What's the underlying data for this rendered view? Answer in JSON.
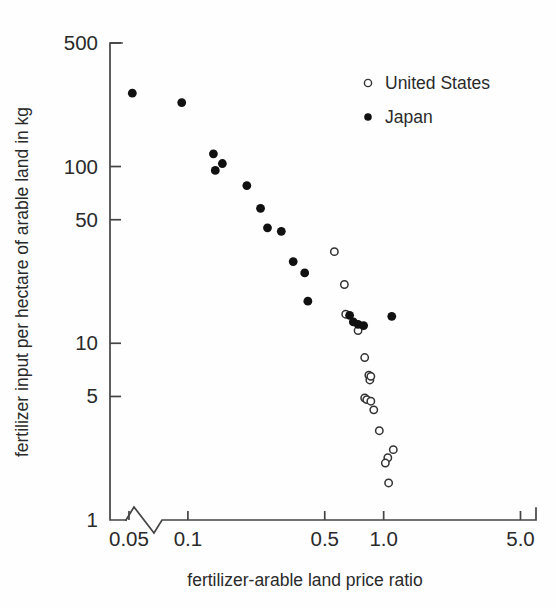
{
  "chart_data": {
    "type": "scatter",
    "title": "",
    "xlabel": "fertilizer-arable land price ratio",
    "ylabel": "fertilizer input per hectare of arable land in kg",
    "xscale": "log",
    "yscale": "log",
    "xlim": [
      0.04,
      6.0
    ],
    "ylim": [
      1,
      500
    ],
    "xticks": [
      0.05,
      0.1,
      0.5,
      1.0,
      5.0
    ],
    "xticklabels": [
      "0.05",
      "0.1",
      "0.5",
      "1.0",
      "5.0"
    ],
    "yticks": [
      1,
      5,
      10,
      50,
      100,
      500
    ],
    "yticklabels": [
      "1",
      "5",
      "10",
      "50",
      "100",
      "500"
    ],
    "grid": false,
    "axis_break": true,
    "axis_break_note": "zigzag break on horizontal axis between origin and 0.05",
    "legend_position": "top-right",
    "series": [
      {
        "name": "United States",
        "marker": "open-circle",
        "color": "#333333",
        "points": [
          [
            0.56,
            33.0
          ],
          [
            0.63,
            21.5
          ],
          [
            0.64,
            14.6
          ],
          [
            0.74,
            11.8
          ],
          [
            0.8,
            8.3
          ],
          [
            0.84,
            6.6
          ],
          [
            0.85,
            6.2
          ],
          [
            0.86,
            6.5
          ],
          [
            0.8,
            4.9
          ],
          [
            0.82,
            4.8
          ],
          [
            0.86,
            4.7
          ],
          [
            0.89,
            4.2
          ],
          [
            0.95,
            3.2
          ],
          [
            1.12,
            2.5
          ],
          [
            1.05,
            2.25
          ],
          [
            1.02,
            2.1
          ],
          [
            1.06,
            1.62
          ]
        ]
      },
      {
        "name": "Japan",
        "marker": "filled-circle",
        "color": "#111111",
        "points": [
          [
            0.052,
            260.0
          ],
          [
            0.093,
            230.0
          ],
          [
            0.135,
            118.0
          ],
          [
            0.15,
            104.0
          ],
          [
            0.138,
            95.0
          ],
          [
            0.2,
            78.0
          ],
          [
            0.235,
            58.0
          ],
          [
            0.255,
            45.0
          ],
          [
            0.3,
            43.0
          ],
          [
            0.345,
            29.0
          ],
          [
            0.395,
            25.0
          ],
          [
            0.41,
            17.3
          ],
          [
            0.67,
            14.4
          ],
          [
            0.7,
            13.2
          ],
          [
            0.74,
            12.8
          ],
          [
            0.79,
            12.6
          ],
          [
            1.1,
            14.2
          ]
        ]
      }
    ]
  },
  "legend": {
    "entries": [
      {
        "label": "United States",
        "marker": "open-circle"
      },
      {
        "label": "Japan",
        "marker": "filled-circle"
      }
    ]
  }
}
